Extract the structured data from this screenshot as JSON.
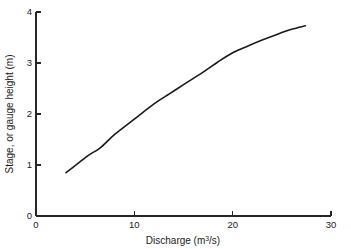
{
  "chart_data": {
    "type": "line",
    "title": "",
    "subtitle": "",
    "xlabel": "Discharge (m",
    "xlabel_sup": "3",
    "xlabel_tail": "/s)",
    "xlabel_full": "Discharge (m3/s)",
    "ylabel": "Stage, or gauge height (m)",
    "xlim": [
      0,
      30
    ],
    "ylim": [
      0,
      4
    ],
    "xticks": [
      0,
      10,
      20,
      30
    ],
    "xtick_labels": [
      "0",
      "10",
      "20",
      "30"
    ],
    "yticks": [
      0,
      1,
      2,
      3,
      4
    ],
    "ytick_labels": [
      "0",
      "1",
      "2",
      "3",
      "4"
    ],
    "grid": false,
    "legend": null,
    "legend_position": "none",
    "series": [
      {
        "name": "rating curve",
        "color": "#1a1a1a",
        "x": [
          3.05,
          4.2,
          5.4,
          6.5,
          8.0,
          10.0,
          12.0,
          13.6,
          15.2,
          17.0,
          18.5,
          20.0,
          21.5,
          23.0,
          24.5,
          26.0,
          27.4
        ],
        "y": [
          0.85,
          1.02,
          1.2,
          1.33,
          1.6,
          1.9,
          2.2,
          2.4,
          2.6,
          2.82,
          3.02,
          3.2,
          3.33,
          3.45,
          3.56,
          3.66,
          3.73
        ]
      }
    ],
    "annotations": []
  },
  "figure": {
    "background_color": "#ffffff",
    "axis_color": "#262626",
    "text_color": "#1a1a1a"
  }
}
